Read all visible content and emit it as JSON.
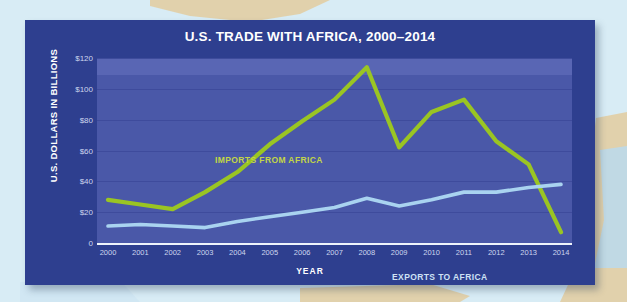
{
  "header": {
    "title": "U.S. TRADE WITH AFRICA, 2000–2014"
  },
  "axes": {
    "y_title": "U.S. DOLLARS IN BILLIONS",
    "x_title": "YEAR",
    "y_ticks": [
      "$120",
      "$100",
      "$80",
      "$60",
      "$40",
      "$20",
      "0"
    ],
    "x_ticks": [
      "2000",
      "2001",
      "2002",
      "2003",
      "2004",
      "2005",
      "2006",
      "2007",
      "2008",
      "2009",
      "2010",
      "2011",
      "2012",
      "2013",
      "2014"
    ]
  },
  "labels": {
    "imports": "IMPORTS FROM AFRICA",
    "exports": "EXPORTS TO AFRICA"
  },
  "colors": {
    "panel": "#2e3f8f",
    "plot": "#4a58a8",
    "plot_band_top": "#5966b4",
    "gridline": "#3d4b9b",
    "imports_line": "#9ac523",
    "exports_line": "#a9d3f0",
    "title_text": "#ffffff",
    "tick_text": "#cdd6ee",
    "page_background": "#d8ecf5",
    "land": "#e2d0a8",
    "baseline": "#eef3fb"
  },
  "chart_data": {
    "type": "line",
    "title": "U.S. TRADE WITH AFRICA, 2000–2014",
    "xlabel": "YEAR",
    "ylabel": "U.S. DOLLARS IN BILLIONS",
    "categories": [
      "2000",
      "2001",
      "2002",
      "2003",
      "2004",
      "2005",
      "2006",
      "2007",
      "2008",
      "2009",
      "2010",
      "2011",
      "2012",
      "2013",
      "2014"
    ],
    "ylim": [
      0,
      120
    ],
    "ytick_values": [
      0,
      20,
      40,
      60,
      80,
      100,
      120
    ],
    "grid": true,
    "legend_position": "inline-annotation",
    "series": [
      {
        "name": "IMPORTS FROM AFRICA",
        "color": "#9ac523",
        "values": [
          28,
          25,
          22,
          33,
          46,
          64,
          79,
          93,
          114,
          62,
          85,
          93,
          66,
          51,
          7
        ]
      },
      {
        "name": "EXPORTS TO AFRICA",
        "color": "#a9d3f0",
        "values": [
          11,
          12,
          11,
          10,
          14,
          17,
          20,
          23,
          29,
          24,
          28,
          33,
          33,
          36,
          38
        ]
      }
    ]
  }
}
